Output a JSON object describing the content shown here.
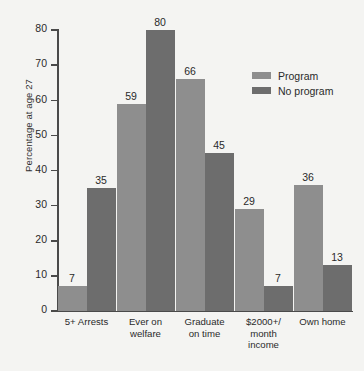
{
  "chart_data": {
    "type": "bar",
    "title": "",
    "xlabel": "",
    "ylabel": "Percentage at age 27",
    "ylim": [
      0,
      80
    ],
    "yticks": [
      0,
      10,
      20,
      30,
      40,
      50,
      60,
      70,
      80
    ],
    "grid": false,
    "legend_position": "inside-top-right",
    "categories": [
      "5+ Arrests",
      "Ever on welfare",
      "Graduate on time",
      "$2000+/ month income",
      "Own home"
    ],
    "category_lines": [
      [
        "5+ Arrests"
      ],
      [
        "Ever on",
        "welfare"
      ],
      [
        "Graduate",
        "on time"
      ],
      [
        "$2000+/",
        "month",
        "income"
      ],
      [
        "Own home"
      ]
    ],
    "series": [
      {
        "name": "Program",
        "color": "#8e8e8e",
        "values": [
          7,
          59,
          66,
          29,
          36
        ]
      },
      {
        "name": "No program",
        "color": "#6d6d6d",
        "values": [
          35,
          80,
          45,
          7,
          13
        ]
      }
    ]
  },
  "colors": {
    "background": "#f4f4f2",
    "axis": "#4a4a4a",
    "text": "#2a2a2a",
    "program": "#8e8e8e",
    "no_program": "#6d6d6d"
  }
}
